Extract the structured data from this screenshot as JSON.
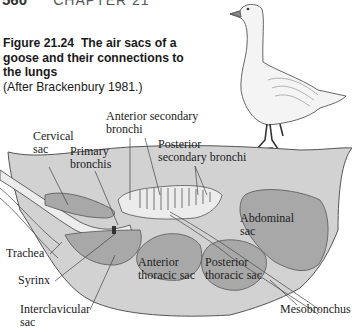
{
  "header": {
    "page_number": "560",
    "chapter": "CHAPTER 21"
  },
  "caption": {
    "figure_label": "Figure 21.24",
    "title": "The air sacs of a goose and their connections to the lungs",
    "source": "(After Brackenbury 1981.)"
  },
  "labels": {
    "cervical_sac": [
      "Cervical",
      "sac"
    ],
    "primary_bronchis": [
      "Primary",
      "bronchis"
    ],
    "anterior_secondary_bronchi": [
      "Anterior secondary",
      "bronchi"
    ],
    "posterior_secondary_bronchi": [
      "Posterior",
      "secondary bronchi"
    ],
    "abdominal_sac": [
      "Abdominal",
      "sac"
    ],
    "trachea": "Trachea",
    "syrinx": "Syrinx",
    "anterior_thoracic_sac": [
      "Anterior",
      "thoracic sac"
    ],
    "posterior_thoracic_sac": [
      "Posterior",
      "thoracic sac"
    ],
    "interclavicular_sac": [
      "Interclavicular",
      "sac"
    ],
    "mesobronchus": "Mesobronchus"
  },
  "colors": {
    "body_fill": "#d2d2d2",
    "sac_fill": "#a8a8a8",
    "line": "#555555",
    "airway_fill": "#ececec"
  }
}
